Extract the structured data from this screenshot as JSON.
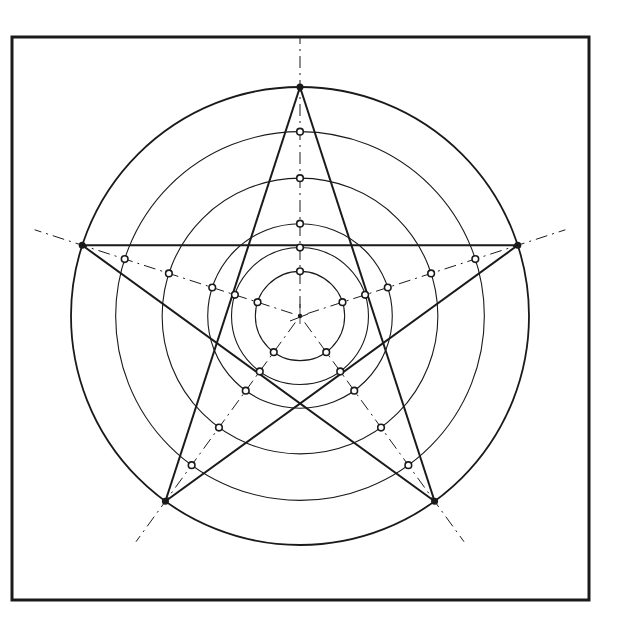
{
  "diagram": {
    "title": "",
    "ink_color": "#1a1a1a",
    "background_color": "#ffffff",
    "circle_count": 6,
    "circle_radius_ratios": [
      1.0,
      0.805,
      0.602,
      0.403,
      0.299,
      0.195
    ],
    "star_points": 5,
    "axis_count": 5,
    "axis_start_angle_deg": -90,
    "marker_rings_per_axis": [
      1,
      2,
      3,
      4,
      5,
      6
    ],
    "labels": []
  }
}
